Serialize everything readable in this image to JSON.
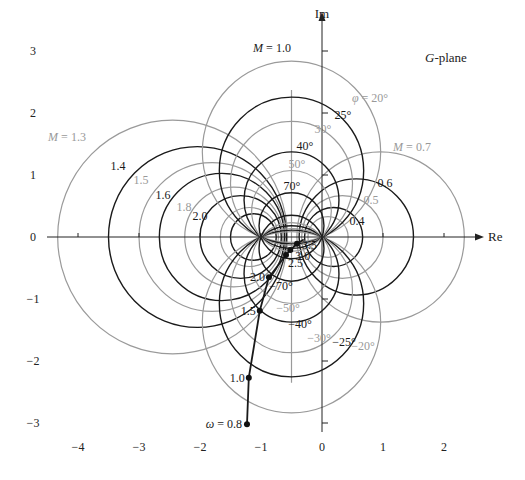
{
  "chart_data": {
    "type": "line",
    "title": "G-plane",
    "xlabel": "Re",
    "ylabel": "Im",
    "xlim": [
      -4.5,
      2.6
    ],
    "ylim": [
      -3.2,
      3.6
    ],
    "x_ticks": [
      -4,
      -3,
      -2,
      -1,
      0,
      1,
      2
    ],
    "y_ticks": [
      3,
      2,
      1,
      0,
      -1,
      -2,
      -3
    ],
    "grid": false,
    "m_circles": [
      {
        "M": 1.3,
        "label": "M = 1.3",
        "color": "gray"
      },
      {
        "M": 1.4,
        "label": "1.4",
        "color": "black"
      },
      {
        "M": 1.5,
        "label": "1.5",
        "color": "gray"
      },
      {
        "M": 1.6,
        "label": "1.6",
        "color": "black"
      },
      {
        "M": 1.8,
        "label": "1.8",
        "color": "gray"
      },
      {
        "M": 2.0,
        "label": "2.0",
        "color": "black"
      },
      {
        "M": 2.5,
        "label": "",
        "color": "gray"
      },
      {
        "M": 3.0,
        "label": "",
        "color": "black"
      },
      {
        "M": 0.7,
        "label": "M = 0.7",
        "color": "gray"
      },
      {
        "M": 0.6,
        "label": "0.6",
        "color": "black"
      },
      {
        "M": 0.5,
        "label": "0.5",
        "color": "gray"
      },
      {
        "M": 0.4,
        "label": "0.4",
        "color": "black"
      },
      {
        "M": 0.3,
        "label": "",
        "color": "gray"
      }
    ],
    "m_line": {
      "M": 1.0,
      "label": "M = 1.0",
      "re": -0.5,
      "im_range": [
        -2.35,
        2.37
      ],
      "color": "gray"
    },
    "n_circles": [
      {
        "phi_deg": 20,
        "label": "φ = 20°",
        "color": "gray"
      },
      {
        "phi_deg": 25,
        "label": "25°",
        "color": "black"
      },
      {
        "phi_deg": 30,
        "label": "30°",
        "color": "gray"
      },
      {
        "phi_deg": 40,
        "label": "40°",
        "color": "black"
      },
      {
        "phi_deg": 50,
        "label": "50°",
        "color": "gray"
      },
      {
        "phi_deg": 70,
        "label": "70°",
        "color": "black"
      },
      {
        "phi_deg": -20,
        "label": "−20°",
        "color": "gray"
      },
      {
        "phi_deg": -25,
        "label": "−25°",
        "color": "black"
      },
      {
        "phi_deg": -30,
        "label": "−30°",
        "color": "gray"
      },
      {
        "phi_deg": -40,
        "label": "−40°",
        "color": "black"
      },
      {
        "phi_deg": -50,
        "label": "−50°",
        "color": "gray"
      },
      {
        "phi_deg": -70,
        "label": "−70°",
        "color": "black"
      }
    ],
    "series": [
      {
        "name": "G(jω) locus",
        "points": [
          {
            "omega": 0.8,
            "label": "ω = 0.8",
            "re": -1.23,
            "im": -3.02
          },
          {
            "omega": 1.0,
            "label": "1.0",
            "re": -1.2,
            "im": -2.27
          },
          {
            "omega": 1.5,
            "label": "1.5",
            "re": -1.02,
            "im": -1.19
          },
          {
            "omega": 2.0,
            "label": "2.0",
            "re": -0.87,
            "im": -0.65
          },
          {
            "omega": 2.5,
            "label": "2.5",
            "re": -0.59,
            "im": -0.29
          },
          {
            "omega": 3.0,
            "label": "3.0",
            "re": -0.52,
            "im": -0.21
          },
          {
            "omega": 3.5,
            "label": "3.5",
            "re": -0.41,
            "im": -0.11
          }
        ]
      }
    ],
    "annotations": [
      "G-plane",
      "M = 1.0",
      "M = 1.3",
      "M = 0.7",
      "φ = 20°"
    ]
  },
  "labels": {
    "plane": "G-plane",
    "re_axis": "Re",
    "im_axis": "Im"
  }
}
